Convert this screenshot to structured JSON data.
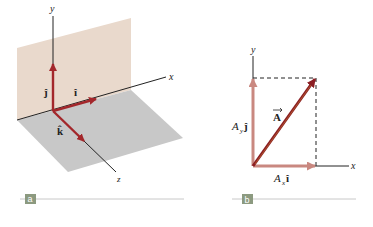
{
  "panels": {
    "a": {
      "badge": "a",
      "axes": {
        "x": "x",
        "y": "y",
        "z": "z"
      },
      "unit_vectors": {
        "i": "î",
        "j": "ĵ",
        "k": "k̂"
      }
    },
    "b": {
      "badge": "b",
      "axes": {
        "x": "x",
        "y": "y"
      },
      "vector": "A",
      "x_component": {
        "symbol": "A",
        "subscript": "x",
        "unit": "î"
      },
      "y_component": {
        "symbol": "A",
        "subscript": "y",
        "unit": "ĵ"
      }
    }
  },
  "colors": {
    "unit_vector": "#a3272b",
    "component": "#c98880",
    "resultant": "#8b1e24",
    "plane_xy": "#e9d9cc",
    "plane_xz": "#c8c8c8",
    "badge": "#8c9a80",
    "caption_line": "#c8c8c8",
    "axis": "#222222"
  }
}
